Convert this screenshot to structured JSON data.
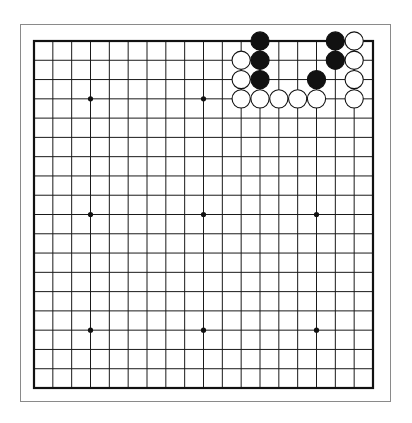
{
  "board": {
    "size": 19,
    "colors": {
      "background": "#ffffff",
      "frame": "#8a8a8a",
      "grid": "#1a1a1a",
      "border": "#111111",
      "black_stone": "#111111",
      "white_stone_fill": "#ffffff",
      "white_stone_stroke": "#111111",
      "star_point": "#111111"
    },
    "star_points": [
      [
        3,
        3
      ],
      [
        9,
        3
      ],
      [
        15,
        3
      ],
      [
        3,
        9
      ],
      [
        9,
        9
      ],
      [
        15,
        9
      ],
      [
        3,
        15
      ],
      [
        9,
        15
      ],
      [
        15,
        15
      ]
    ],
    "stones": [
      {
        "col": 12,
        "row": 0,
        "color": "black"
      },
      {
        "col": 16,
        "row": 0,
        "color": "black"
      },
      {
        "col": 17,
        "row": 0,
        "color": "white"
      },
      {
        "col": 11,
        "row": 1,
        "color": "white"
      },
      {
        "col": 12,
        "row": 1,
        "color": "black"
      },
      {
        "col": 16,
        "row": 1,
        "color": "black"
      },
      {
        "col": 17,
        "row": 1,
        "color": "white"
      },
      {
        "col": 11,
        "row": 2,
        "color": "white"
      },
      {
        "col": 12,
        "row": 2,
        "color": "black"
      },
      {
        "col": 15,
        "row": 2,
        "color": "black"
      },
      {
        "col": 17,
        "row": 2,
        "color": "white"
      },
      {
        "col": 11,
        "row": 3,
        "color": "white"
      },
      {
        "col": 12,
        "row": 3,
        "color": "white"
      },
      {
        "col": 13,
        "row": 3,
        "color": "white"
      },
      {
        "col": 14,
        "row": 3,
        "color": "white"
      },
      {
        "col": 15,
        "row": 3,
        "color": "white"
      },
      {
        "col": 17,
        "row": 3,
        "color": "white"
      }
    ]
  }
}
